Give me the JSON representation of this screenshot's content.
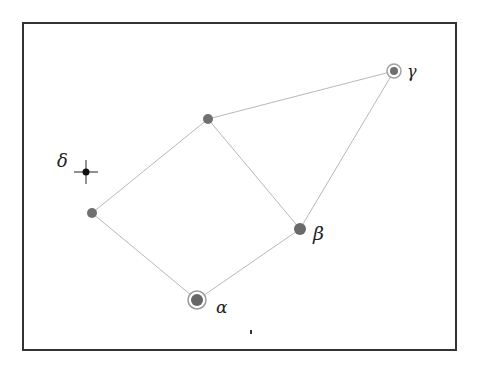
{
  "diagram": {
    "type": "graph",
    "frame": {
      "x": 23,
      "y": 23,
      "width": 433,
      "height": 327
    },
    "colors": {
      "node": "#6e6e6e",
      "edge": "#b8b8b8",
      "frame": "#333333",
      "cross": "#111111",
      "ring": "#9a9a9a"
    },
    "nodes": [
      {
        "id": "gamma",
        "label": "γ",
        "x": 394,
        "y": 71,
        "r": 4,
        "ring": true
      },
      {
        "id": "top",
        "label": "",
        "x": 208,
        "y": 119,
        "r": 5,
        "ring": false
      },
      {
        "id": "left",
        "label": "",
        "x": 92,
        "y": 213,
        "r": 5,
        "ring": false
      },
      {
        "id": "beta",
        "label": "β",
        "x": 300,
        "y": 229,
        "r": 6,
        "ring": false
      },
      {
        "id": "alpha",
        "label": "α",
        "x": 197,
        "y": 300,
        "r": 6,
        "ring": true
      }
    ],
    "edges": [
      {
        "from": "top",
        "to": "gamma"
      },
      {
        "from": "gamma",
        "to": "beta"
      },
      {
        "from": "top",
        "to": "left"
      },
      {
        "from": "top",
        "to": "beta"
      },
      {
        "from": "left",
        "to": "alpha"
      },
      {
        "from": "alpha",
        "to": "beta"
      }
    ],
    "marker": {
      "id": "delta",
      "label": "δ",
      "x": 86,
      "y": 172
    },
    "labels": {
      "gamma": "γ",
      "beta": "β",
      "alpha": "α",
      "delta": "δ"
    }
  }
}
